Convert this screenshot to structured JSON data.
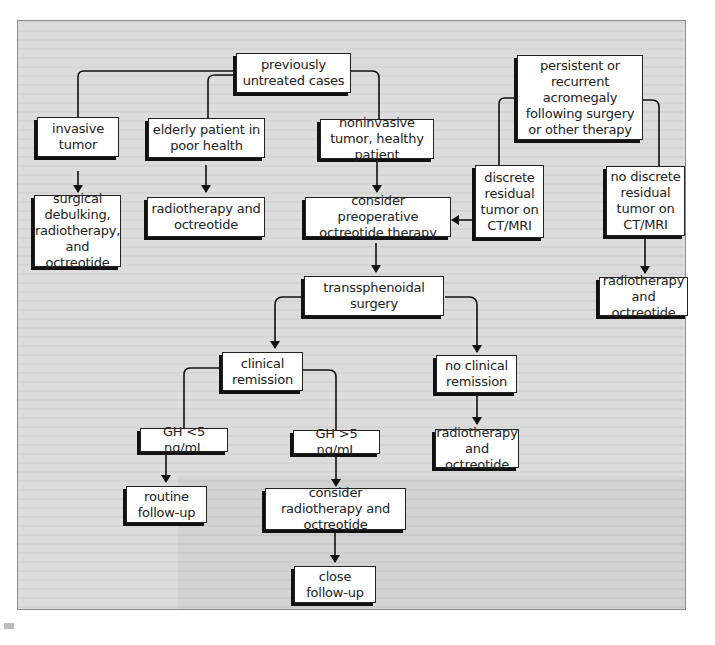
{
  "diagram": {
    "type": "flowchart",
    "topic": "acromegaly treatment algorithm",
    "nodes": {
      "previously_untreated": "previously untreated cases",
      "invasive_tumor": "invasive tumor",
      "elderly_patient": "elderly patient in poor health",
      "noninvasive_tumor": "noninvasive tumor, healthy patient",
      "surgical_debulking": "surgical debulking, radiotherapy, and octreotide",
      "radiotherapy_octreotide_1": "radiotherapy and octreotide",
      "consider_preoperative": "consider preoperative octreotide therapy",
      "persistent_recurrent": "persistent or recurrent acromegaly following surgery or other therapy",
      "discrete_residual": "discrete residual tumor on CT/MRI",
      "no_discrete_residual": "no discrete residual tumor on CT/MRI",
      "radiotherapy_octreotide_2": "radiotherapy and octreotide",
      "transsphenoidal_surgery": "transsphenoidal surgery",
      "clinical_remission": "clinical remission",
      "no_clinical_remission": "no clinical remission",
      "radiotherapy_octreotide_3": "radiotherapy and octreotide",
      "gh_lt5": "GH <5 ng/mL",
      "gh_gt5": "GH >5 ng/mL",
      "routine_followup": "routine follow-up",
      "consider_radiotherapy": "consider radiotherapy and octreotide",
      "close_followup": "close follow-up"
    },
    "edges": [
      [
        "previously_untreated",
        "invasive_tumor"
      ],
      [
        "previously_untreated",
        "elderly_patient"
      ],
      [
        "previously_untreated",
        "noninvasive_tumor"
      ],
      [
        "invasive_tumor",
        "surgical_debulking"
      ],
      [
        "elderly_patient",
        "radiotherapy_octreotide_1"
      ],
      [
        "noninvasive_tumor",
        "consider_preoperative"
      ],
      [
        "persistent_recurrent",
        "discrete_residual"
      ],
      [
        "persistent_recurrent",
        "no_discrete_residual"
      ],
      [
        "discrete_residual",
        "consider_preoperative"
      ],
      [
        "no_discrete_residual",
        "radiotherapy_octreotide_2"
      ],
      [
        "consider_preoperative",
        "transsphenoidal_surgery"
      ],
      [
        "transsphenoidal_surgery",
        "clinical_remission"
      ],
      [
        "transsphenoidal_surgery",
        "no_clinical_remission"
      ],
      [
        "no_clinical_remission",
        "radiotherapy_octreotide_3"
      ],
      [
        "clinical_remission",
        "gh_lt5"
      ],
      [
        "clinical_remission",
        "gh_gt5"
      ],
      [
        "gh_lt5",
        "routine_followup"
      ],
      [
        "gh_gt5",
        "consider_radiotherapy"
      ],
      [
        "consider_radiotherapy",
        "close_followup"
      ]
    ]
  }
}
